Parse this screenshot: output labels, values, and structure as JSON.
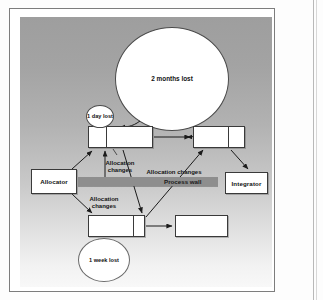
{
  "figure": {
    "background_top_color": "#9e9e9e",
    "background_bottom_color": "#f8f8f8",
    "wall_color": "#8e8e8e",
    "node_fill": "#ffffff",
    "stroke_color": "#3a3a3a"
  },
  "nodes": [
    {
      "id": "allocator",
      "label": "Allocator",
      "x": 11,
      "y": 152,
      "w": 46,
      "h": 25,
      "split": false
    },
    {
      "id": "top_left_task",
      "label": "",
      "x": 68,
      "y": 109,
      "w": 65,
      "h": 22,
      "split": true,
      "split_at": 17
    },
    {
      "id": "top_right_task",
      "label": "",
      "x": 173,
      "y": 109,
      "w": 52,
      "h": 22,
      "split": true,
      "split_at": 34
    },
    {
      "id": "integrator",
      "label": "Integrator",
      "x": 205,
      "y": 155,
      "w": 43,
      "h": 22,
      "split": false
    },
    {
      "id": "bottom_left_task",
      "label": "",
      "x": 68,
      "y": 198,
      "w": 57,
      "h": 22,
      "split": true,
      "split_at": 44
    },
    {
      "id": "bottom_right_task",
      "label": "",
      "x": 155,
      "y": 198,
      "w": 53,
      "h": 22,
      "split": false
    }
  ],
  "delay_bubbles": [
    {
      "id": "one_day_lost",
      "label": "1 day\nlost",
      "cx": 80,
      "cy": 100,
      "rx": 14,
      "ry": 11.5
    },
    {
      "id": "two_months_lost",
      "label": "2 months\nlost",
      "cx": 152,
      "cy": 62,
      "rx": 57,
      "ry": 52
    },
    {
      "id": "one_week_lost",
      "label": "1 week\nlost",
      "cx": 84,
      "cy": 243,
      "rx": 26,
      "ry": 22
    }
  ],
  "wall": {
    "label": "Process wall",
    "x": 58,
    "y": 160,
    "w": 140,
    "h": 9,
    "label_x": 150,
    "label_y": 160
  },
  "edge_labels": [
    {
      "id": "label_left_upper",
      "text": "Allocation\nchanges",
      "x": 82,
      "y": 140
    },
    {
      "id": "label_left_lower",
      "text": "Allocation\nchanges",
      "x": 67,
      "y": 176
    },
    {
      "id": "label_right",
      "text": "Allocation changes",
      "x": 128,
      "y": 146
    }
  ],
  "edges": [
    {
      "id": "allocator_to_top",
      "from": "allocator",
      "to": "top_left_task",
      "arrow": "end"
    },
    {
      "id": "allocator_to_bottom",
      "from": "allocator",
      "to": "bottom_left_task",
      "arrow": "end"
    },
    {
      "id": "wall_up_to_top",
      "from": "wall",
      "to": "top_left_task",
      "arrow": "end"
    },
    {
      "id": "top_to_topright",
      "from": "top_left_task",
      "to": "top_right_task",
      "arrow": "end"
    },
    {
      "id": "top_down_to_bottom",
      "from": "top_left_task",
      "to": "bottom_left_task",
      "arrow": "end"
    },
    {
      "id": "bottom_to_topright",
      "from": "bottom_left_task",
      "to": "top_right_task",
      "arrow": "end"
    },
    {
      "id": "topright_to_integrator",
      "from": "top_right_task",
      "to": "integrator",
      "arrow": "end"
    },
    {
      "id": "bottom_to_bottomright",
      "from": "bottom_left_task",
      "to": "bottom_right_task",
      "arrow": "end"
    },
    {
      "id": "bigcircle_to_topright",
      "from": "two_months_lost",
      "to": "top_right_task",
      "arrow": "end"
    },
    {
      "id": "bigcircle_to_topleft",
      "from": "two_months_lost",
      "to": "top_left_task",
      "arrow": "end"
    },
    {
      "id": "oneweek_to_bottom",
      "from": "one_week_lost",
      "to": "bottom_left_task",
      "arrow": "end"
    },
    {
      "id": "oneday_to_topleft",
      "from": "one_day_lost",
      "to": "top_left_task",
      "arrow": "end"
    }
  ]
}
